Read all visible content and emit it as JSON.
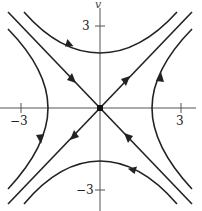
{
  "diagram": {
    "type": "phase-portrait",
    "axes": {
      "x_axis": {
        "label": "",
        "ticks": [
          {
            "value": -3,
            "label": "−3"
          },
          {
            "value": 3,
            "label": "3"
          }
        ]
      },
      "y_axis": {
        "label": "v",
        "ticks": [
          {
            "value": 3,
            "label": "3"
          },
          {
            "value": -3,
            "label": "−3"
          }
        ]
      }
    },
    "equilibrium": {
      "x": 0,
      "y": 0,
      "kind": "saddle"
    },
    "separatrices": [
      {
        "name": "stable-manifold",
        "direction": "y = -x",
        "flow": "toward origin"
      },
      {
        "name": "unstable-manifold",
        "direction": "y = x",
        "flow": "away from origin"
      }
    ],
    "trajectories": [
      {
        "name": "top-hyperbola",
        "vertex": [
          0,
          2.05
        ],
        "flow": "left-to-right"
      },
      {
        "name": "bottom-hyperbola",
        "vertex": [
          0,
          -2.0
        ],
        "flow": "right-to-left"
      },
      {
        "name": "left-hyperbola",
        "vertex": [
          -1.95,
          0
        ],
        "flow": "downward"
      },
      {
        "name": "right-hyperbola",
        "vertex": [
          1.95,
          0
        ],
        "flow": "upward"
      }
    ],
    "colors": {
      "curve": "#222222",
      "axis": "#555555",
      "background": "#ffffff"
    }
  }
}
